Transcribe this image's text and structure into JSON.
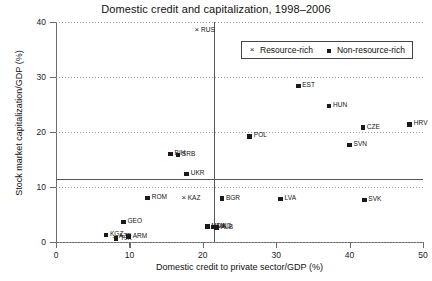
{
  "chart_data": {
    "type": "scatter",
    "title": "Domestic credit and capitalization, 1998–2006",
    "xlabel": "Domestic credit to private sector/GDP (%)",
    "ylabel": "Stock market capitalization/GDP (%)",
    "xlim": [
      0,
      50
    ],
    "ylim": [
      0,
      40
    ],
    "xticks": [
      0,
      10,
      20,
      30,
      40,
      50
    ],
    "yticks": [
      0,
      10,
      20,
      30,
      40
    ],
    "grid": "horizontal-dotted",
    "legend_position": "top-right-inside",
    "reference_lines": [
      {
        "orientation": "horizontal",
        "value": 11.5
      },
      {
        "orientation": "vertical",
        "value": 21.5
      }
    ],
    "legend": [
      {
        "name": "Resource-rich",
        "marker": "x"
      },
      {
        "name": "Non-resource-rich",
        "marker": "square"
      }
    ],
    "series": [
      {
        "name": "Resource-rich",
        "marker": "x",
        "points": [
          {
            "label": "RUS",
            "x": 19.2,
            "y": 38.4,
            "label_side": "right"
          },
          {
            "label": "KAZ",
            "x": 17.4,
            "y": 7.9,
            "label_side": "right"
          },
          {
            "label": "AZE",
            "x": 8.0,
            "y": 0.9,
            "label_side": "right"
          }
        ]
      },
      {
        "name": "Non-resource-rich",
        "marker": "square",
        "points": [
          {
            "label": "EST",
            "x": 33.0,
            "y": 28.4,
            "label_side": "right"
          },
          {
            "label": "HUN",
            "x": 37.2,
            "y": 24.7,
            "label_side": "right"
          },
          {
            "label": "CZE",
            "x": 41.8,
            "y": 20.8,
            "label_side": "right"
          },
          {
            "label": "HRV",
            "x": 48.2,
            "y": 21.4,
            "label_side": "right"
          },
          {
            "label": "SVN",
            "x": 40.0,
            "y": 17.6,
            "label_side": "right"
          },
          {
            "label": "POL",
            "x": 26.4,
            "y": 19.2,
            "label_side": "right"
          },
          {
            "label": "SVK",
            "x": 42.0,
            "y": 7.6,
            "label_side": "right"
          },
          {
            "label": "BIH",
            "x": 15.6,
            "y": 16.0,
            "label_side": "right"
          },
          {
            "label": "SRB",
            "x": 16.6,
            "y": 15.8,
            "label_side": "right"
          },
          {
            "label": "UKR",
            "x": 17.8,
            "y": 12.4,
            "label_side": "right"
          },
          {
            "label": "ROM",
            "x": 12.5,
            "y": 8.0,
            "label_side": "right"
          },
          {
            "label": "BGR",
            "x": 22.6,
            "y": 7.9,
            "label_side": "right"
          },
          {
            "label": "LVA",
            "x": 30.6,
            "y": 7.8,
            "label_side": "right"
          },
          {
            "label": "GEO",
            "x": 9.2,
            "y": 3.6,
            "label_side": "right"
          },
          {
            "label": "KGZ",
            "x": 6.8,
            "y": 1.3,
            "label_side": "right"
          },
          {
            "label": "TJK",
            "x": 8.2,
            "y": 0.6,
            "label_side": "right"
          },
          {
            "label": "ARM",
            "x": 9.9,
            "y": 1.0,
            "label_side": "right"
          },
          {
            "label": "MDA",
            "x": 20.6,
            "y": 2.8,
            "label_side": "right"
          },
          {
            "label": "MKD",
            "x": 21.4,
            "y": 2.7,
            "label_side": "right"
          },
          {
            "label": "ALB",
            "x": 21.9,
            "y": 2.6,
            "label_side": "right"
          }
        ]
      }
    ]
  }
}
